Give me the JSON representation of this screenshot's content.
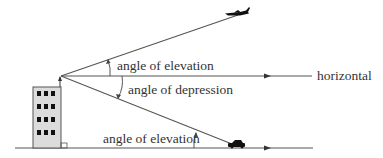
{
  "diagram": {
    "labels": {
      "upper_elevation": "angle of elevation",
      "depression": "angle of depression",
      "lower_elevation": "angle of elevation",
      "horizontal": "horizontal"
    },
    "objects": {
      "observer": "building-observer",
      "aircraft": "airplane",
      "vehicle": "car"
    },
    "colors": {
      "line": "#555555",
      "building_fill": "#dcdcdc",
      "window": "#111111",
      "text": "#333333"
    }
  }
}
